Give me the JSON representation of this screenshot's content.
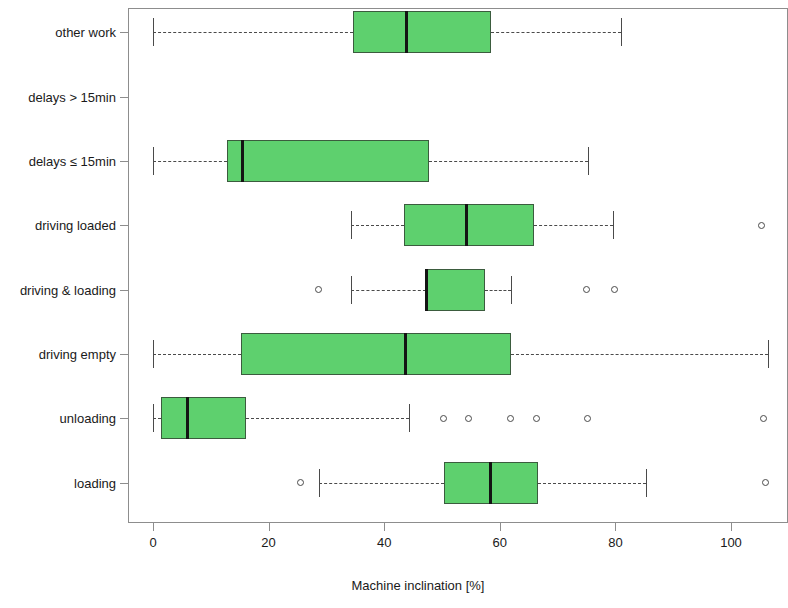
{
  "chart_data": {
    "type": "box",
    "title": "",
    "xlabel": "Machine inclination [%]",
    "ylabel": "",
    "xlim": [
      -4,
      110
    ],
    "xticks": [
      0,
      20,
      40,
      60,
      80,
      100
    ],
    "xticklabels": [
      "0",
      "20",
      "40",
      "60",
      "80",
      "100"
    ],
    "grid": false,
    "orientation": "horizontal",
    "box_fill_color": "#5ED06E",
    "box_edge_color": "#3b5c3e",
    "median_color": "#141414",
    "whisker_color": "#4a4a4a",
    "categories": [
      "other work",
      "delays > 15min",
      "delays ≤ 15min",
      "driving loaded",
      "driving & loading",
      "driving empty",
      "unloading",
      "loading"
    ],
    "boxes": [
      {
        "category": "other work",
        "has_data": true,
        "whisker_low": 0.0,
        "q1": 34.6,
        "median": 43.8,
        "q3": 58.5,
        "whisker_high": 81.0,
        "outliers": []
      },
      {
        "category": "delays > 15min",
        "has_data": false,
        "whisker_low": null,
        "q1": null,
        "median": null,
        "q3": null,
        "whisker_high": null,
        "outliers": []
      },
      {
        "category": "delays ≤ 15min",
        "has_data": true,
        "whisker_low": 0.0,
        "q1": 12.8,
        "median": 15.4,
        "q3": 47.8,
        "whisker_high": 75.3,
        "outliers": []
      },
      {
        "category": "driving loaded",
        "has_data": true,
        "whisker_low": 34.3,
        "q1": 43.4,
        "median": 54.2,
        "q3": 65.9,
        "whisker_high": 79.6,
        "outliers": [
          105.2
        ]
      },
      {
        "category": "driving & loading",
        "has_data": true,
        "whisker_low": 34.3,
        "q1": 47.2,
        "median": 47.2,
        "q3": 57.4,
        "whisker_high": 61.9,
        "outliers": [
          28.7,
          75.0,
          79.8
        ]
      },
      {
        "category": "driving empty",
        "has_data": true,
        "whisker_low": 0.0,
        "q1": 15.2,
        "median": 43.6,
        "q3": 61.9,
        "whisker_high": 106.4,
        "outliers": []
      },
      {
        "category": "unloading",
        "has_data": true,
        "whisker_low": 0.0,
        "q1": 1.4,
        "median": 5.9,
        "q3": 16.1,
        "whisker_high": 44.3,
        "outliers": [
          50.3,
          54.5,
          61.8,
          66.3,
          75.1,
          105.7
        ]
      },
      {
        "category": "loading",
        "has_data": true,
        "whisker_low": 28.7,
        "q1": 50.3,
        "median": 58.3,
        "q3": 66.6,
        "whisker_high": 85.3,
        "outliers": [
          25.6,
          105.9
        ]
      }
    ]
  },
  "axis": {
    "x_title": "Machine inclination [%]"
  }
}
